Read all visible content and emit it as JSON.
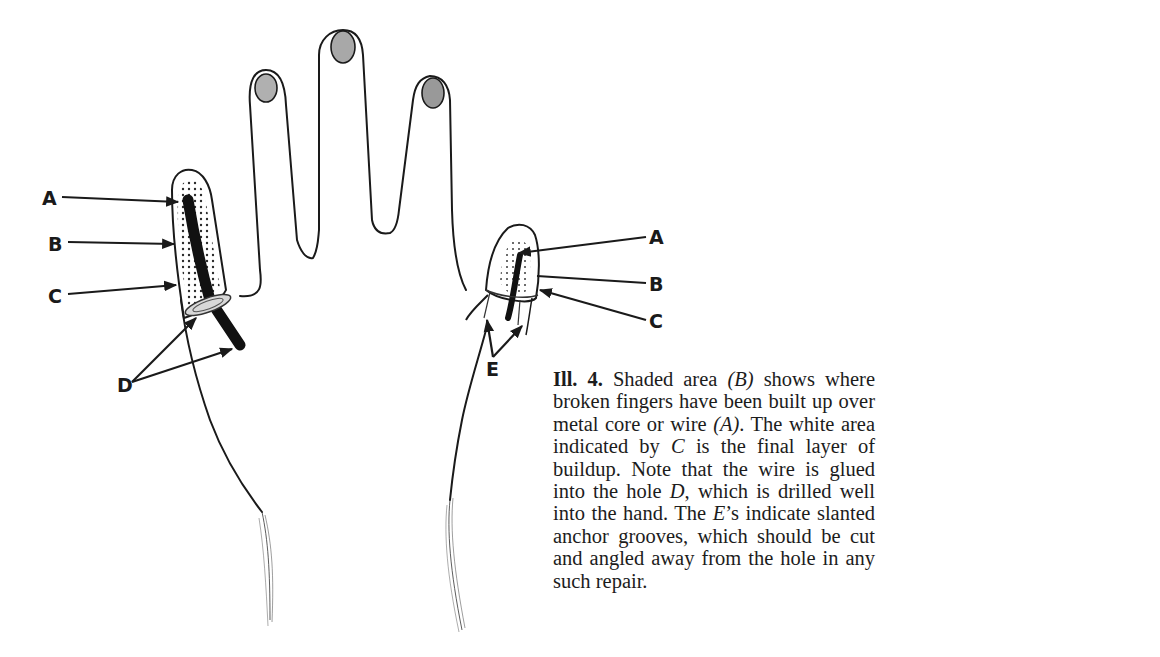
{
  "figure": {
    "left_labels": {
      "A": "A",
      "B": "B",
      "C": "C",
      "D": "D"
    },
    "right_labels": {
      "A": "A",
      "B": "B",
      "C": "C",
      "E": "E"
    }
  },
  "caption": {
    "label": "Ill. 4.",
    "text_1": " Shaded area ",
    "ref_B": "(B)",
    "text_2": " shows where broken fingers have been built up over metal core or wire ",
    "ref_A": "(A)",
    "text_3": ". The white area indicated by ",
    "ref_C": "C",
    "text_4": " is the final layer of buildup. Note that the wire is glued into the hole ",
    "ref_D": "D",
    "text_5": ", which is drilled well into the hand. The ",
    "ref_E": "E",
    "text_6": "’s indicate slanted anchor grooves, which should be cut and angled away from the hole in any such repair."
  },
  "colors": {
    "line": "#1a1a1a",
    "nail": "#a8a8a8",
    "wire": "#111111",
    "stipple": "#2a2a2a"
  }
}
